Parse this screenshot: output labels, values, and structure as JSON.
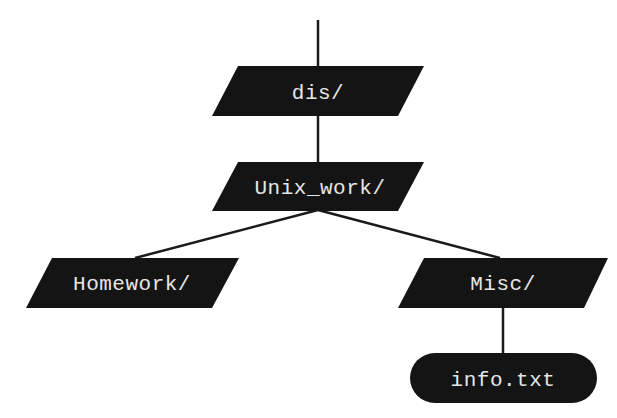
{
  "diagram": {
    "type": "directory-tree",
    "colors": {
      "node_fill": "#141414",
      "node_text": "#e6e6e6",
      "edge": "#1a1a1a",
      "background": "#ffffff"
    },
    "nodes": [
      {
        "id": "dis",
        "label": "dis/",
        "kind": "directory",
        "shape": "parallelogram"
      },
      {
        "id": "unix_work",
        "label": "Unix_work/",
        "kind": "directory",
        "shape": "parallelogram"
      },
      {
        "id": "homework",
        "label": "Homework/",
        "kind": "directory",
        "shape": "parallelogram"
      },
      {
        "id": "misc",
        "label": "Misc/",
        "kind": "directory",
        "shape": "parallelogram"
      },
      {
        "id": "info",
        "label": "info.txt",
        "kind": "file",
        "shape": "rounded-pill"
      }
    ],
    "edges": [
      {
        "from": "parent",
        "to": "dis"
      },
      {
        "from": "dis",
        "to": "unix_work"
      },
      {
        "from": "unix_work",
        "to": "homework"
      },
      {
        "from": "unix_work",
        "to": "misc"
      },
      {
        "from": "misc",
        "to": "info"
      }
    ]
  }
}
